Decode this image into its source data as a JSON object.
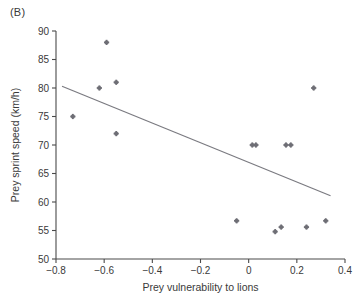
{
  "panel": {
    "label": "(B)"
  },
  "chart_data": {
    "type": "scatter",
    "title": "",
    "xlabel": "Prey vulnerability to lions",
    "ylabel": "Prey sprint speed (km/h)",
    "xlim": [
      -0.8,
      0.4
    ],
    "ylim": [
      50,
      90
    ],
    "xticks": [
      -0.8,
      -0.6,
      -0.4,
      -0.2,
      0,
      0.2,
      0.4
    ],
    "xticklabels": [
      "−0.8",
      "−0.6",
      "−0.4",
      "−0.2",
      "0",
      "0.2",
      "0.4"
    ],
    "yticks": [
      50,
      55,
      60,
      65,
      70,
      75,
      80,
      85,
      90
    ],
    "yticklabels": [
      "50",
      "55",
      "60",
      "65",
      "70",
      "75",
      "80",
      "85",
      "90"
    ],
    "grid": false,
    "legend": null,
    "marker_color": "#6e6e75",
    "line_color": "#7a7a80",
    "points": [
      {
        "x": -0.73,
        "y": 75.0
      },
      {
        "x": -0.62,
        "y": 80.0
      },
      {
        "x": -0.59,
        "y": 88.0
      },
      {
        "x": -0.55,
        "y": 81.0
      },
      {
        "x": -0.55,
        "y": 72.0
      },
      {
        "x": -0.05,
        "y": 56.7
      },
      {
        "x": 0.015,
        "y": 70.0
      },
      {
        "x": 0.03,
        "y": 70.0
      },
      {
        "x": 0.11,
        "y": 54.8
      },
      {
        "x": 0.135,
        "y": 55.6
      },
      {
        "x": 0.155,
        "y": 70.0
      },
      {
        "x": 0.175,
        "y": 70.0
      },
      {
        "x": 0.24,
        "y": 55.6
      },
      {
        "x": 0.27,
        "y": 80.0
      },
      {
        "x": 0.32,
        "y": 56.7
      }
    ],
    "trendline": {
      "x0": -0.775,
      "y0": 80.3,
      "x1": 0.34,
      "y1": 61.1
    }
  }
}
